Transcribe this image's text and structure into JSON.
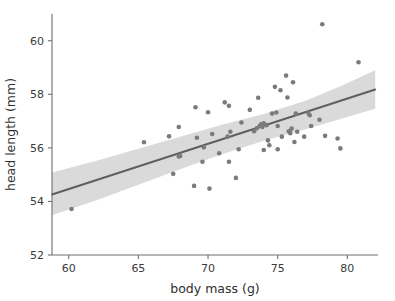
{
  "chart_data": {
    "type": "scatter",
    "title": "",
    "xlabel": "body mass (g)",
    "ylabel": "head length (mm)",
    "xlim": [
      58.8,
      82.2
    ],
    "ylim": [
      52.0,
      61.0
    ],
    "xticks": [
      60,
      65,
      70,
      75,
      80
    ],
    "xticklabels": [
      "60",
      "65",
      "70",
      "75",
      "80"
    ],
    "yticks": [
      52,
      54,
      56,
      58,
      60
    ],
    "yticklabels": [
      "52",
      "54",
      "56",
      "58",
      "60"
    ],
    "grid": false,
    "legend": null,
    "series": [
      {
        "name": "observations",
        "type": "scatter",
        "marker": "circle",
        "color": "#7b7b7b",
        "points": [
          [
            60.2,
            53.72
          ],
          [
            65.4,
            56.21
          ],
          [
            67.2,
            56.43
          ],
          [
            67.5,
            55.03
          ],
          [
            67.9,
            56.78
          ],
          [
            67.9,
            55.68
          ],
          [
            68.0,
            55.7
          ],
          [
            69.0,
            54.58
          ],
          [
            69.1,
            57.52
          ],
          [
            69.2,
            56.38
          ],
          [
            69.6,
            55.48
          ],
          [
            69.7,
            56.02
          ],
          [
            70.0,
            57.33
          ],
          [
            70.1,
            54.48
          ],
          [
            70.3,
            56.52
          ],
          [
            70.8,
            55.8
          ],
          [
            71.2,
            57.7
          ],
          [
            71.4,
            56.42
          ],
          [
            71.5,
            57.57
          ],
          [
            71.5,
            55.48
          ],
          [
            71.6,
            56.6
          ],
          [
            72.0,
            54.88
          ],
          [
            72.2,
            55.95
          ],
          [
            72.4,
            56.95
          ],
          [
            73.0,
            57.42
          ],
          [
            73.3,
            56.62
          ],
          [
            73.5,
            56.73
          ],
          [
            73.6,
            57.87
          ],
          [
            73.7,
            56.82
          ],
          [
            73.8,
            56.88
          ],
          [
            73.9,
            56.78
          ],
          [
            74.0,
            56.92
          ],
          [
            74.0,
            55.92
          ],
          [
            74.2,
            56.85
          ],
          [
            74.3,
            56.28
          ],
          [
            74.4,
            56.1
          ],
          [
            74.6,
            57.28
          ],
          [
            74.8,
            58.28
          ],
          [
            74.9,
            57.32
          ],
          [
            75.0,
            56.82
          ],
          [
            75.0,
            55.95
          ],
          [
            75.2,
            58.15
          ],
          [
            75.3,
            56.42
          ],
          [
            75.6,
            58.7
          ],
          [
            75.7,
            57.88
          ],
          [
            75.8,
            56.62
          ],
          [
            75.9,
            56.55
          ],
          [
            76.0,
            56.72
          ],
          [
            76.1,
            58.45
          ],
          [
            76.2,
            56.22
          ],
          [
            76.3,
            57.28
          ],
          [
            76.4,
            56.6
          ],
          [
            76.9,
            56.42
          ],
          [
            77.2,
            57.3
          ],
          [
            77.3,
            57.22
          ],
          [
            77.4,
            56.82
          ],
          [
            78.0,
            57.05
          ],
          [
            78.2,
            60.62
          ],
          [
            78.4,
            56.45
          ],
          [
            79.3,
            56.35
          ],
          [
            79.5,
            55.98
          ],
          [
            80.8,
            59.2
          ]
        ]
      },
      {
        "name": "regression-line",
        "type": "line",
        "color": "#5f5f5f",
        "x": [
          58.8,
          82.0
        ],
        "y": [
          54.26,
          58.18
        ]
      },
      {
        "name": "confidence-band",
        "type": "area",
        "color": "#d4d4d4",
        "x": [
          58.8,
          62.0,
          65.0,
          68.0,
          71.0,
          74.0,
          77.0,
          79.5,
          82.0
        ],
        "y_upper": [
          55.08,
          55.52,
          55.97,
          56.42,
          56.86,
          57.27,
          57.76,
          58.3,
          58.9
        ],
        "y_lower": [
          53.48,
          54.04,
          54.62,
          55.2,
          55.76,
          56.27,
          56.7,
          57.08,
          57.46
        ]
      }
    ]
  }
}
